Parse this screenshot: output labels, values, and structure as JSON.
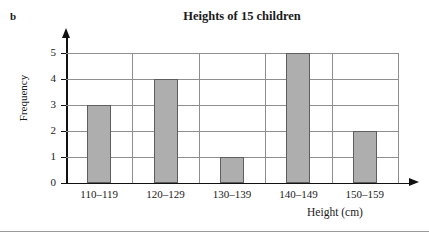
{
  "figure": {
    "part_label": "b"
  },
  "chart_data": {
    "type": "bar",
    "title": "Heights of 15 children",
    "xlabel": "Height (cm)",
    "ylabel": "Frequency",
    "categories": [
      "110–119",
      "120–129",
      "130–139",
      "140–149",
      "150–159"
    ],
    "values": [
      3,
      4,
      1,
      5,
      2
    ],
    "ylim": [
      0,
      5
    ],
    "ytick_labels": [
      "0",
      "1",
      "2",
      "3",
      "4",
      "5"
    ],
    "ytick_values": [
      0,
      1,
      2,
      3,
      4,
      5
    ],
    "grid": "both",
    "legend": "none",
    "bar_color": "#aeaeae",
    "bar_edge_color": "#5e5e5e",
    "grid_color": "#8e8e8e",
    "axis_color": "#111111"
  }
}
